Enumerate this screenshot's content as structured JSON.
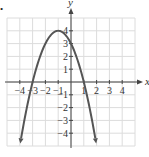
{
  "chart_data": {
    "type": "line",
    "title": "",
    "xlabel": "x",
    "ylabel": "y",
    "xlim": [
      -5,
      5
    ],
    "ylim": [
      -5,
      5
    ],
    "grid": true,
    "x_ticks": [
      -4,
      -3,
      -2,
      -1,
      1,
      2,
      3,
      4
    ],
    "y_ticks": [
      -4,
      -3,
      -2,
      -1,
      1,
      2,
      3,
      4
    ],
    "series": [
      {
        "name": "parabola",
        "equation": "y = -x^2 - 2x + 3",
        "vertex": [
          -1,
          4
        ],
        "x_intercepts": [
          -3,
          1
        ],
        "y_intercept": 3,
        "x": [
          -3.2,
          -3,
          -2,
          -1,
          0,
          1,
          2
        ],
        "values": [
          -0.84,
          0,
          3,
          4,
          3,
          0,
          -5
        ],
        "color": "#555555",
        "arrows_at_ends": true
      }
    ]
  },
  "marker": "•"
}
